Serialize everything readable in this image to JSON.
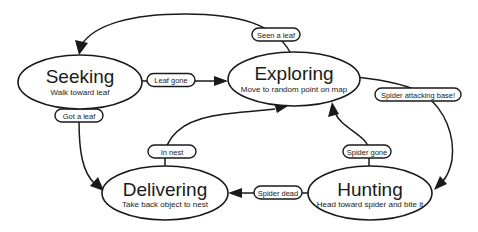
{
  "diagram": {
    "states": [
      {
        "id": "seeking",
        "name": "Seeking",
        "description": "Walk toward leaf"
      },
      {
        "id": "exploring",
        "name": "Exploring",
        "description": "Move to random point on map"
      },
      {
        "id": "delivering",
        "name": "Delivering",
        "description": "Take back object to nest"
      },
      {
        "id": "hunting",
        "name": "Hunting",
        "description": "Head toward spider and bite it"
      }
    ],
    "transitions": [
      {
        "from": "exploring",
        "to": "seeking",
        "label": "Seen a leaf"
      },
      {
        "from": "seeking",
        "to": "exploring",
        "label": "Leaf gone"
      },
      {
        "from": "seeking",
        "to": "delivering",
        "label": "Got a leaf"
      },
      {
        "from": "delivering",
        "to": "exploring",
        "label": "In nest"
      },
      {
        "from": "exploring",
        "to": "hunting",
        "label": "Spider attacking base!"
      },
      {
        "from": "hunting",
        "to": "exploring",
        "label": "Spider gone"
      },
      {
        "from": "hunting",
        "to": "delivering",
        "label": "Spider dead"
      }
    ]
  }
}
